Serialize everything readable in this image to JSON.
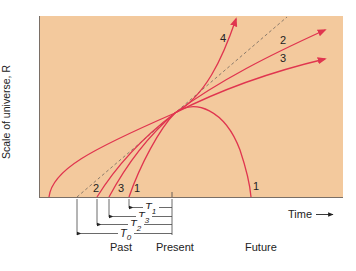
{
  "figure": {
    "ylabel": "Scale of universe, R",
    "xlabel": "Time",
    "xlabel_arrow": "arrow-right-icon",
    "time_labels": {
      "past": "Past",
      "present": "Present",
      "future": "Future"
    },
    "curve_labels": {
      "curve_1_lower": "1",
      "curve_1_fall": "1",
      "curve_2_lower": "2",
      "curve_2_upper": "2",
      "curve_3_lower": "3",
      "curve_3_upper": "3",
      "curve_4_upper": "4"
    },
    "intervals": [
      {
        "name": "T",
        "sub": "1"
      },
      {
        "name": "T",
        "sub": "3"
      },
      {
        "name": "T",
        "sub": "2"
      },
      {
        "name": "T",
        "sub": "0"
      }
    ],
    "colors": {
      "panel_bg": "#f3c99d",
      "curve": "#e0354f",
      "dashed_line": "#8a7a6a",
      "axis": "#6b6b6b",
      "text": "#222222"
    }
  }
}
